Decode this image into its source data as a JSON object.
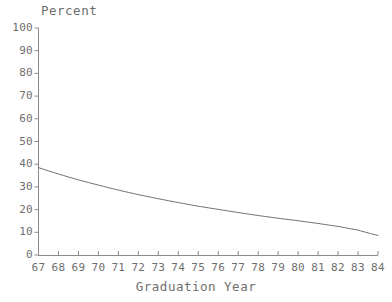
{
  "chart_data": {
    "type": "line",
    "title": "",
    "xlabel": "Graduation Year",
    "ylabel": "Percent",
    "xlim": [
      67,
      84
    ],
    "ylim": [
      0,
      100
    ],
    "grid": false,
    "legend": "none",
    "line_color": "#6e6e6e",
    "axis_color": "#8a8a8a",
    "text_color": "#6e6e6e",
    "background": "#ffffff",
    "x_tick_labels": [
      "67",
      "68",
      "69",
      "70",
      "71",
      "72",
      "73",
      "74",
      "75",
      "76",
      "77",
      "78",
      "79",
      "80",
      "81",
      "82",
      "83",
      "84"
    ],
    "y_tick_labels": [
      "0",
      "10",
      "20",
      "30",
      "40",
      "50",
      "60",
      "70",
      "80",
      "90",
      "100"
    ],
    "x": [
      67,
      68,
      69,
      70,
      71,
      72,
      73,
      74,
      75,
      76,
      77,
      78,
      79,
      80,
      81,
      82,
      83,
      84
    ],
    "values": [
      38.5,
      35.7,
      33.1,
      30.8,
      28.6,
      26.6,
      24.8,
      23.1,
      21.5,
      20.1,
      18.7,
      17.4,
      16.2,
      15.1,
      13.9,
      12.6,
      11.0,
      8.6
    ],
    "series": [
      {
        "name": "Percent",
        "values": [
          38.5,
          35.7,
          33.1,
          30.8,
          28.6,
          26.6,
          24.8,
          23.1,
          21.5,
          20.1,
          18.7,
          17.4,
          16.2,
          15.1,
          13.9,
          12.6,
          11.0,
          8.6
        ]
      }
    ]
  }
}
